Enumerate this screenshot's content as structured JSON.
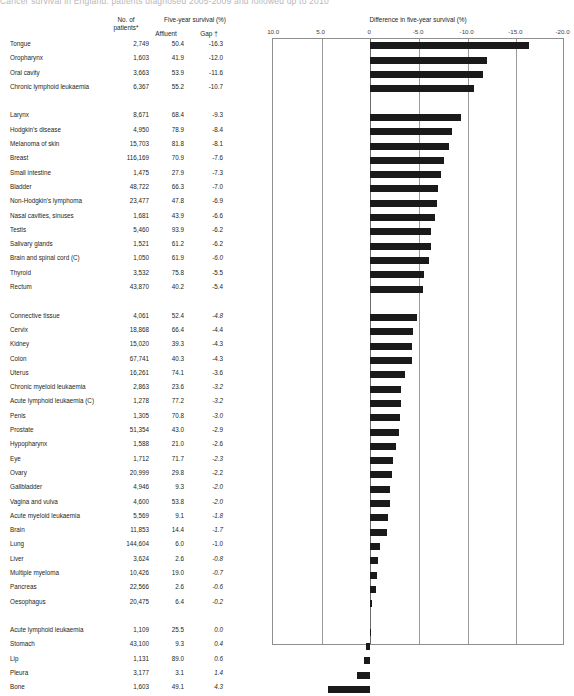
{
  "top_banner": "Cancer survival in England: patients diagnosed 2005-2009 and followed up to 2010",
  "headers": {
    "no_of_patients": "No. of\npatients*",
    "no_of_patients_l1": "No. of",
    "no_of_patients_l2": "patients*",
    "five_year_survival": "Five-year survival (%)",
    "affluent": "Affluent",
    "gap": "Gap †",
    "chart_title": "Difference in five-year survival (%)"
  },
  "chart_data": {
    "type": "bar",
    "orientation": "horizontal",
    "title": "Difference in five-year survival (%)",
    "xlabel": "Difference in five-year survival (%)",
    "ylabel": "",
    "xlim": [
      10.0,
      -20.0
    ],
    "xticks": [
      10.0,
      5.0,
      0,
      -5.0,
      -10.0,
      -15.0,
      -20.0
    ],
    "xticklabels": [
      "10.0",
      "5.0",
      "0",
      "-5.0",
      "-10.0",
      "-15.0",
      "-20.0"
    ],
    "grid": true,
    "legend": null,
    "bar_color": "#1a1a1a",
    "categories": [
      "Tongue",
      "Oropharynx",
      "Oral cavity",
      "Chronic lymphoid leukaemia",
      "Larynx",
      "Hodgkin's disease",
      "Melanoma of skin",
      "Breast",
      "Small intestine",
      "Bladder",
      "Non-Hodgkin's lymphoma",
      "Nasal cavities, sinuses",
      "Testis",
      "Salivary glands",
      "Brain and spinal cord (C)",
      "Thyroid",
      "Rectum",
      "Connective tissue",
      "Cervix",
      "Kidney",
      "Colon",
      "Uterus",
      "Chronic myeloid leukaemia",
      "Acute lymphoid leukaemia (C)",
      "Penis",
      "Prostate",
      "Hypopharynx",
      "Eye",
      "Ovary",
      "Gallbladder",
      "Vagina and vulva",
      "Acute myeloid leukaemia",
      "Brain",
      "Lung",
      "Liver",
      "Multiple myeloma",
      "Pancreas",
      "Oesophagus",
      "Acute lymphoid leukaemia",
      "Stomach",
      "Lip",
      "Pleura",
      "Bone"
    ],
    "values": [
      -16.3,
      -12.0,
      -11.6,
      -10.7,
      -9.3,
      -8.4,
      -8.1,
      -7.6,
      -7.3,
      -7.0,
      -6.9,
      -6.6,
      -6.2,
      -6.2,
      -6.0,
      -5.5,
      -5.4,
      -4.8,
      -4.4,
      -4.3,
      -4.3,
      -3.6,
      -3.2,
      -3.2,
      -3.0,
      -2.9,
      -2.6,
      -2.3,
      -2.2,
      -2.0,
      -2.0,
      -1.8,
      -1.7,
      -1.0,
      -0.8,
      -0.7,
      -0.6,
      -0.2,
      0.0,
      0.4,
      0.6,
      1.4,
      4.3
    ]
  },
  "table": {
    "columns": [
      "Site",
      "No. of patients*",
      "Affluent",
      "Gap †"
    ],
    "groups": [
      {
        "rows": [
          {
            "site": "Tongue",
            "patients": "2,749",
            "affluent": "50.4",
            "gap": "-16.3",
            "gap_italic": false
          },
          {
            "site": "Oropharynx",
            "patients": "1,603",
            "affluent": "41.9",
            "gap": "-12.0",
            "gap_italic": false
          },
          {
            "site": "Oral cavity",
            "patients": "3,663",
            "affluent": "53.9",
            "gap": "-11.6",
            "gap_italic": false
          },
          {
            "site": "Chronic lymphoid leukaemia",
            "patients": "6,367",
            "affluent": "55.2",
            "gap": "-10.7",
            "gap_italic": false
          }
        ]
      },
      {
        "rows": [
          {
            "site": "Larynx",
            "patients": "8,671",
            "affluent": "68.4",
            "gap": "-9.3",
            "gap_italic": false
          },
          {
            "site": "Hodgkin's disease",
            "patients": "4,950",
            "affluent": "78.9",
            "gap": "-8.4",
            "gap_italic": false
          },
          {
            "site": "Melanoma of skin",
            "patients": "15,703",
            "affluent": "81.8",
            "gap": "-8.1",
            "gap_italic": false
          },
          {
            "site": "Breast",
            "patients": "116,169",
            "affluent": "70.9",
            "gap": "-7.6",
            "gap_italic": false
          },
          {
            "site": "Small intestine",
            "patients": "1,475",
            "affluent": "27.9",
            "gap": "-7.3",
            "gap_italic": false
          },
          {
            "site": "Bladder",
            "patients": "48,722",
            "affluent": "66.3",
            "gap": "-7.0",
            "gap_italic": false
          },
          {
            "site": "Non-Hodgkin's lymphoma",
            "patients": "23,477",
            "affluent": "47.8",
            "gap": "-6.9",
            "gap_italic": false
          },
          {
            "site": "Nasal cavities, sinuses",
            "patients": "1,681",
            "affluent": "43.9",
            "gap": "-6.6",
            "gap_italic": false
          },
          {
            "site": "Testis",
            "patients": "5,460",
            "affluent": "93.9",
            "gap": "-6.2",
            "gap_italic": false
          },
          {
            "site": "Salivary glands",
            "patients": "1,521",
            "affluent": "61.2",
            "gap": "-6.2",
            "gap_italic": false
          },
          {
            "site": "Brain and spinal cord (C)",
            "patients": "1,050",
            "affluent": "61.9",
            "gap": "-6.0",
            "gap_italic": true
          },
          {
            "site": "Thyroid",
            "patients": "3,532",
            "affluent": "75.8",
            "gap": "-5.5",
            "gap_italic": false
          },
          {
            "site": "Rectum",
            "patients": "43,870",
            "affluent": "40.2",
            "gap": "-5.4",
            "gap_italic": false
          }
        ]
      },
      {
        "rows": [
          {
            "site": "Connective tissue",
            "patients": "4,061",
            "affluent": "52.4",
            "gap": "-4.8",
            "gap_italic": true
          },
          {
            "site": "Cervix",
            "patients": "18,868",
            "affluent": "66.4",
            "gap": "-4.4",
            "gap_italic": false
          },
          {
            "site": "Kidney",
            "patients": "15,020",
            "affluent": "39.3",
            "gap": "-4.3",
            "gap_italic": false
          },
          {
            "site": "Colon",
            "patients": "67,741",
            "affluent": "40.3",
            "gap": "-4.3",
            "gap_italic": false
          },
          {
            "site": "Uterus",
            "patients": "16,261",
            "affluent": "74.1",
            "gap": "-3.6",
            "gap_italic": false
          },
          {
            "site": "Chronic myeloid leukaemia",
            "patients": "2,863",
            "affluent": "23.6",
            "gap": "-3.2",
            "gap_italic": true
          },
          {
            "site": "Acute lymphoid leukaemia (C)",
            "patients": "1,278",
            "affluent": "77.2",
            "gap": "-3.2",
            "gap_italic": true
          },
          {
            "site": "Penis",
            "patients": "1,305",
            "affluent": "70.8",
            "gap": "-3.0",
            "gap_italic": true
          },
          {
            "site": "Prostate",
            "patients": "51,354",
            "affluent": "43.0",
            "gap": "-2.9",
            "gap_italic": false
          },
          {
            "site": "Hypopharynx",
            "patients": "1,588",
            "affluent": "21.0",
            "gap": "-2.6",
            "gap_italic": false
          },
          {
            "site": "Eye",
            "patients": "1,712",
            "affluent": "71.7",
            "gap": "-2.3",
            "gap_italic": true
          },
          {
            "site": "Ovary",
            "patients": "20,999",
            "affluent": "29.8",
            "gap": "-2.2",
            "gap_italic": false
          },
          {
            "site": "Gallbladder",
            "patients": "4,946",
            "affluent": "9.3",
            "gap": "-2.0",
            "gap_italic": true
          },
          {
            "site": "Vagina and vulva",
            "patients": "4,600",
            "affluent": "53.8",
            "gap": "-2.0",
            "gap_italic": true
          },
          {
            "site": "Acute myeloid leukaemia",
            "patients": "5,569",
            "affluent": "9.1",
            "gap": "-1.8",
            "gap_italic": true
          },
          {
            "site": "Brain",
            "patients": "11,853",
            "affluent": "14.4",
            "gap": "-1.7",
            "gap_italic": true
          },
          {
            "site": "Lung",
            "patients": "144,604",
            "affluent": "6.0",
            "gap": "-1.0",
            "gap_italic": false
          },
          {
            "site": "Liver",
            "patients": "3,624",
            "affluent": "2.6",
            "gap": "-0.8",
            "gap_italic": true
          },
          {
            "site": "Multiple myeloma",
            "patients": "10,426",
            "affluent": "19.0",
            "gap": "-0.7",
            "gap_italic": true
          },
          {
            "site": "Pancreas",
            "patients": "22,566",
            "affluent": "2.6",
            "gap": "-0.6",
            "gap_italic": true
          },
          {
            "site": "Oesophagus",
            "patients": "20,475",
            "affluent": "6.4",
            "gap": "-0.2",
            "gap_italic": true
          }
        ]
      },
      {
        "rows": [
          {
            "site": "Acute lymphoid leukaemia",
            "patients": "1,109",
            "affluent": "25.5",
            "gap": "0.0",
            "gap_italic": true
          },
          {
            "site": "Stomach",
            "patients": "43,100",
            "affluent": "9.3",
            "gap": "0.4",
            "gap_italic": true
          },
          {
            "site": "Lip",
            "patients": "1,131",
            "affluent": "89.0",
            "gap": "0.6",
            "gap_italic": true
          },
          {
            "site": "Pleura",
            "patients": "3,177",
            "affluent": "3.1",
            "gap": "1.4",
            "gap_italic": true
          },
          {
            "site": "Bone",
            "patients": "1,603",
            "affluent": "49.1",
            "gap": "4.3",
            "gap_italic": true
          }
        ]
      }
    ]
  }
}
